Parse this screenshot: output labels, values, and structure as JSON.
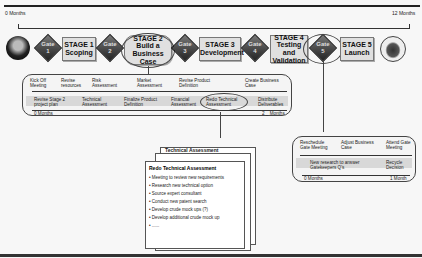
{
  "timeline": {
    "start": "0 Months",
    "end": "12 Months"
  },
  "stages": [
    {
      "label": "STAGE 1",
      "sub": "Scoping"
    },
    {
      "label": "STAGE 2",
      "sub": "Build a Business Case"
    },
    {
      "label": "STAGE 3",
      "sub": "Development"
    },
    {
      "label": "STAGE 4",
      "sub": "Testing and Validation"
    },
    {
      "label": "STAGE 5",
      "sub": "Launch"
    }
  ],
  "gates": [
    {
      "label": "Gate",
      "num": "1"
    },
    {
      "label": "Gate",
      "num": "2"
    },
    {
      "label": "Gate",
      "num": "3"
    },
    {
      "label": "Gate",
      "num": "4"
    },
    {
      "label": "Gate",
      "num": "5"
    }
  ],
  "stage2_panel": {
    "top_items": [
      "Kick Off Meeting",
      "Revise resources",
      "Risk Assessment",
      "Market Assessment",
      "Revise Product Definition",
      "Create Business Case"
    ],
    "bottom_items": [
      "Revise Stage 2 project plan",
      "Technical Assessment",
      "Finalize Product Definition",
      "Financial Assessment",
      "Redo Technical Assessment",
      "Distribute Deliverables"
    ],
    "start": "0 Months",
    "end": "2 _ Months"
  },
  "document": {
    "back_title": "Technical Assessment",
    "title": "Redo Technical Assessment",
    "items": [
      "• Meeting to review new requirements",
      "• Research new technical option",
      "• Source expert consultant",
      "• Conduct new patent search",
      "• Develop crude mock ups (?)",
      "• Develop additional crude mock up",
      "• ......"
    ]
  },
  "gate5_panel": {
    "top_items": [
      "Reschedule Gate Meeting",
      "Adjust Business Case",
      "Attend Gate Meeting"
    ],
    "bottom_items": [
      "New research to answer Gatekeepers Q's",
      "Recycle Decision"
    ],
    "start": "0 Months",
    "end": "1 Month"
  }
}
